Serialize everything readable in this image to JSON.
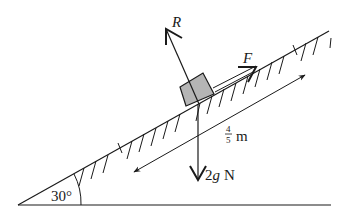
{
  "diagram": {
    "type": "inclined-plane-force-diagram",
    "labels": {
      "normal_reaction": "R",
      "applied_force": "F",
      "weight_value": "2",
      "weight_var": "g",
      "weight_unit": "N",
      "distance_num": "4",
      "distance_den": "5",
      "distance_unit": "m",
      "angle": "30°"
    },
    "colors": {
      "ink": "#1a1a1a",
      "block_fill": "#b5b5b5",
      "background": "#ffffff"
    }
  }
}
